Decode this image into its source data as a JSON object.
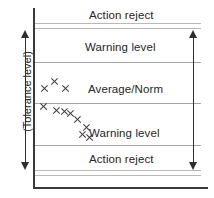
{
  "chart_data": {
    "type": "scatter",
    "title": "",
    "xlabel": "",
    "ylabel": "(Tolerance level)",
    "grid": true,
    "legend": "none",
    "xlim": [
      0,
      100
    ],
    "ylim": [
      0,
      100
    ],
    "annotations": [
      {
        "text": "Action reject",
        "zone": "upper-action-reject"
      },
      {
        "text": "Warning level",
        "zone": "upper-warning"
      },
      {
        "text": "Average/Norm",
        "zone": "average-norm"
      },
      {
        "text": "Warning level",
        "zone": "lower-warning"
      },
      {
        "text": "Action reject",
        "zone": "lower-action-reject"
      }
    ],
    "bands": [
      {
        "name": "Action reject",
        "label": "Action reject",
        "y_top": 8,
        "y_bottom": 23
      },
      {
        "name": "Warning level",
        "label": "Warning level",
        "y_top": 28,
        "y_bottom": 62
      },
      {
        "name": "Average/Norm",
        "label": "Average/Norm",
        "y_top": 62,
        "y_bottom": 103
      },
      {
        "name": "Warning level",
        "label": "Warning level",
        "y_top": 103,
        "y_bottom": 145
      },
      {
        "name": "Action reject",
        "label": "Action reject",
        "y_top": 145,
        "y_bottom": 170
      }
    ],
    "band_lines": [
      23,
      28,
      62,
      103,
      145,
      170,
      175
    ],
    "points": [
      {
        "x": 44,
        "y": 88
      },
      {
        "x": 54,
        "y": 81
      },
      {
        "x": 65,
        "y": 88
      },
      {
        "x": 43,
        "y": 106
      },
      {
        "x": 56,
        "y": 110
      },
      {
        "x": 64,
        "y": 111
      },
      {
        "x": 70,
        "y": 113
      },
      {
        "x": 77,
        "y": 119
      },
      {
        "x": 86,
        "y": 127
      },
      {
        "x": 82,
        "y": 134
      },
      {
        "x": 89,
        "y": 137
      }
    ]
  },
  "labels": {
    "upper_action_reject": "Action reject",
    "upper_warning_level": "Warning level",
    "average_norm": "Average/Norm",
    "lower_warning_level": "Warning level",
    "lower_action_reject": "Action reject",
    "tolerance_level": "(Tolerance level)"
  },
  "colors": {
    "axis": "#3a3a3a",
    "band_line": "#b9b9b9",
    "text": "#262626",
    "marker": "#3d3d3d",
    "arrow": "#2e2e2e",
    "background": "#ffffff"
  }
}
